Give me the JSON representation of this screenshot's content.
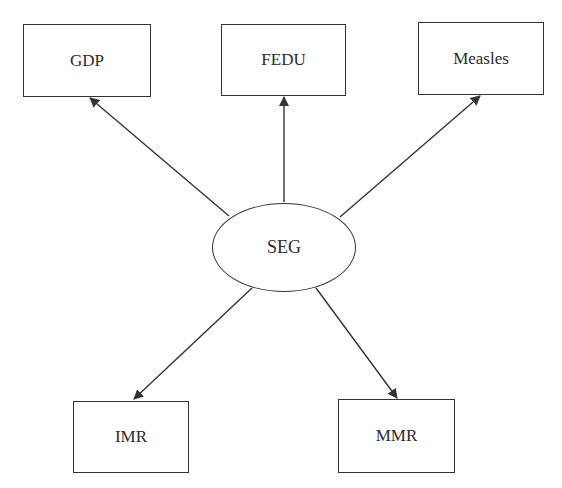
{
  "diagram": {
    "type": "path-diagram",
    "center": {
      "id": "seg",
      "label": "SEG",
      "shape": "ellipse"
    },
    "nodes": [
      {
        "id": "gdp",
        "label": "GDP",
        "shape": "rectangle"
      },
      {
        "id": "fedu",
        "label": "FEDU",
        "shape": "rectangle"
      },
      {
        "id": "measles",
        "label": "Measles",
        "shape": "rectangle"
      },
      {
        "id": "imr",
        "label": "IMR",
        "shape": "rectangle"
      },
      {
        "id": "mmr",
        "label": "MMR",
        "shape": "rectangle"
      }
    ],
    "edges": [
      {
        "from": "SEG",
        "to": "GDP",
        "directed": true
      },
      {
        "from": "SEG",
        "to": "FEDU",
        "directed": true
      },
      {
        "from": "SEG",
        "to": "Measles",
        "directed": true
      },
      {
        "from": "SEG",
        "to": "IMR",
        "directed": true
      },
      {
        "from": "SEG",
        "to": "MMR",
        "directed": true
      }
    ],
    "colors": {
      "line": "#333333",
      "text": "#2a2a2a",
      "background": "#ffffff"
    }
  }
}
